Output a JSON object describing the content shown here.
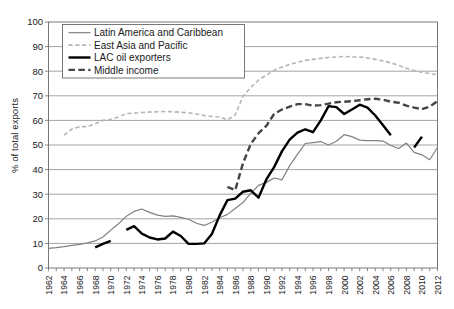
{
  "chart_data": {
    "type": "line",
    "title": "",
    "xlabel": "",
    "ylabel": "% of total exports",
    "ylim": [
      0,
      100
    ],
    "xlim": [
      1962,
      2012
    ],
    "ytick_step": 10,
    "xtick_step": 2,
    "grid": "horizontal",
    "legend_position": "top-left inside plot",
    "yticks": [
      "100",
      "90",
      "80",
      "70",
      "60",
      "50",
      "40",
      "30",
      "20",
      "10",
      "0"
    ],
    "xticks": [
      "1962",
      "1964",
      "1966",
      "1968",
      "1970",
      "1972",
      "1974",
      "1976",
      "1978",
      "1980",
      "1982",
      "1984",
      "1986",
      "1988",
      "1990",
      "1992",
      "1994",
      "1996",
      "1998",
      "2000",
      "2002",
      "2004",
      "2006",
      "2008",
      "2010",
      "2012"
    ],
    "series": [
      {
        "name": "Latin America and Caribbean",
        "color": "#808080",
        "style": "solid",
        "width": 1.2,
        "x": [
          1962,
          1963,
          1964,
          1965,
          1966,
          1967,
          1968,
          1969,
          1970,
          1971,
          1972,
          1973,
          1974,
          1975,
          1976,
          1977,
          1978,
          1979,
          1980,
          1981,
          1982,
          1983,
          1984,
          1985,
          1986,
          1987,
          1988,
          1989,
          1990,
          1991,
          1992,
          1993,
          1994,
          1995,
          1996,
          1997,
          1998,
          1999,
          2000,
          2001,
          2002,
          2003,
          2004,
          2005,
          2006,
          2007,
          2008,
          2009,
          2010,
          2011,
          2012
        ],
        "values": [
          8.0,
          8.3,
          8.7,
          9.2,
          9.6,
          10.2,
          11.0,
          12.6,
          15.4,
          18.0,
          21.0,
          23.0,
          24.0,
          22.6,
          21.5,
          21.0,
          21.2,
          20.6,
          19.8,
          18.2,
          17.3,
          18.6,
          20.4,
          21.8,
          24.2,
          26.6,
          30.4,
          33.6,
          34.8,
          36.6,
          35.8,
          41.6,
          46.2,
          50.6,
          51.0,
          51.4,
          50.0,
          51.5,
          54.2,
          53.4,
          52.0,
          51.8,
          51.8,
          51.6,
          49.8,
          48.6,
          50.8,
          47.0,
          46.0,
          44.0,
          49.0
        ]
      },
      {
        "name": "East Asia and Pacific",
        "color": "#b5b5b5",
        "style": "dashed",
        "width": 1.6,
        "x": [
          1964,
          1965,
          1966,
          1967,
          1968,
          1969,
          1970,
          1971,
          1972,
          1973,
          1974,
          1975,
          1976,
          1977,
          1978,
          1979,
          1980,
          1981,
          1982,
          1983,
          1984,
          1985,
          1986,
          1987,
          1988,
          1989,
          1990,
          1991,
          1992,
          1993,
          1994,
          1995,
          1996,
          1997,
          1998,
          1999,
          2000,
          2001,
          2002,
          2003,
          2004,
          2005,
          2006,
          2007,
          2008,
          2009,
          2010,
          2011,
          2012
        ],
        "values": [
          54.0,
          56.5,
          57.4,
          57.5,
          58.6,
          60.0,
          60.4,
          61.4,
          62.8,
          63.0,
          63.2,
          63.4,
          63.5,
          63.6,
          63.5,
          63.3,
          63.1,
          62.6,
          62.0,
          61.6,
          61.4,
          60.2,
          62.2,
          69.8,
          73.4,
          76.4,
          78.4,
          80.4,
          81.6,
          82.8,
          83.6,
          84.4,
          84.8,
          85.2,
          85.6,
          85.8,
          86.0,
          85.8,
          85.8,
          85.4,
          84.8,
          84.2,
          83.4,
          82.4,
          81.2,
          80.2,
          79.6,
          79.0,
          78.6
        ]
      },
      {
        "name": "LAC oil exporters",
        "color": "#000000",
        "style": "solid",
        "width": 2.4,
        "segments": [
          {
            "x": [
              1968,
              1969,
              1970
            ],
            "values": [
              8.4,
              9.8,
              11.0
            ]
          },
          {
            "x": [
              1972,
              1973,
              1974,
              1975,
              1976,
              1977,
              1978,
              1979,
              1980,
              1981,
              1982,
              1983,
              1984,
              1985,
              1986,
              1987,
              1988,
              1989,
              1990,
              1991,
              1992,
              1993,
              1994,
              1995,
              1996,
              1997,
              1998,
              1999,
              2000,
              2001,
              2002,
              2003,
              2004,
              2005,
              2006
            ],
            "values": [
              15.5,
              17.0,
              14.0,
              12.4,
              11.6,
              12.0,
              14.8,
              13.0,
              9.8,
              9.8,
              10.0,
              13.8,
              21.4,
              27.6,
              28.2,
              31.0,
              31.6,
              28.6,
              36.0,
              41.0,
              47.4,
              52.2,
              55.0,
              56.4,
              55.2,
              60.0,
              65.8,
              65.4,
              62.6,
              64.4,
              66.4,
              65.2,
              62.0,
              58.0,
              54.0
            ]
          },
          {
            "x": [
              2009,
              2010
            ],
            "values": [
              49.0,
              53.4
            ]
          }
        ]
      },
      {
        "name": "Middle income",
        "color": "#444444",
        "style": "long-dashed",
        "width": 2.4,
        "x": [
          1985,
          1986,
          1987,
          1988,
          1989,
          1990,
          1991,
          1992,
          1993,
          1994,
          1995,
          1996,
          1997,
          1998,
          1999,
          2000,
          2001,
          2002,
          2003,
          2004,
          2005,
          2006,
          2007,
          2008,
          2009,
          2010,
          2011,
          2012
        ],
        "values": [
          33.0,
          31.6,
          42.6,
          50.4,
          54.8,
          57.8,
          62.6,
          64.4,
          65.6,
          66.6,
          66.6,
          66.0,
          66.2,
          66.8,
          67.4,
          67.6,
          67.8,
          68.2,
          68.6,
          68.8,
          68.4,
          67.6,
          67.2,
          66.0,
          65.2,
          64.6,
          65.6,
          67.8
        ]
      }
    ],
    "legend": [
      {
        "label": "Latin America and Caribbean",
        "color": "#808080",
        "style": "solid",
        "width": 1.2
      },
      {
        "label": "East Asia and Pacific",
        "color": "#b5b5b5",
        "style": "dashed",
        "width": 1.6
      },
      {
        "label": "LAC oil exporters",
        "color": "#000000",
        "style": "solid",
        "width": 2.4
      },
      {
        "label": "Middle income",
        "color": "#444444",
        "style": "long-dashed",
        "width": 2.4
      }
    ]
  }
}
